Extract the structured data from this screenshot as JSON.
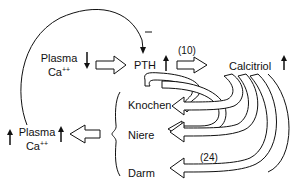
{
  "diagram": {
    "nodes": {
      "plasma_ca_low": {
        "line1": "Plasma",
        "line2": "Ca",
        "sup": "++",
        "trend": "down"
      },
      "pth": {
        "label": "PTH",
        "trend": "up"
      },
      "calcitriol": {
        "label": "Calcitriol",
        "trend": "up"
      },
      "knochen": {
        "label": "Knochen"
      },
      "niere": {
        "label": "Niere"
      },
      "darm": {
        "label": "Darm"
      },
      "plasma_ca_high": {
        "line1": "Plasma",
        "line2": "Ca",
        "sup": "++",
        "trend": "up"
      }
    },
    "edges": {
      "feedback_sign": "−",
      "pth_to_calcitriol_ref": "(10)",
      "calcitriol_to_darm_ref": "(24)"
    }
  }
}
